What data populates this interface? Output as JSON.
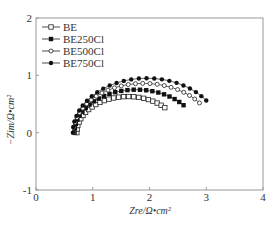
{
  "chart_data": {
    "type": "scatter",
    "title": "",
    "xlabel": "Zre/Ω•cm²",
    "ylabel": "−Zim/Ω•cm²",
    "xlim": [
      0,
      4
    ],
    "ylim": [
      -1,
      2
    ],
    "xticks": [
      "0",
      "1",
      "2",
      "3",
      "4"
    ],
    "yticks": [
      "-1",
      "0",
      "1",
      "2"
    ],
    "grid": false,
    "legend_position": "top-left",
    "series": [
      {
        "name": "BE",
        "marker": "open-square",
        "x0": 0.72,
        "x1": 2.27,
        "peak": 0.63,
        "end_y": 0.05
      },
      {
        "name": "BE250Cl",
        "marker": "filled-square",
        "x0": 0.68,
        "x1": 2.6,
        "peak": 0.75,
        "end_y": 0.15
      },
      {
        "name": "BE500Cl",
        "marker": "open-circle",
        "x0": 0.66,
        "x1": 2.88,
        "peak": 0.86,
        "end_y": 0.23
      },
      {
        "name": "BE750Cl",
        "marker": "filled-circle",
        "x0": 0.65,
        "x1": 3.0,
        "peak": 0.95,
        "end_y": 0.4
      }
    ]
  }
}
